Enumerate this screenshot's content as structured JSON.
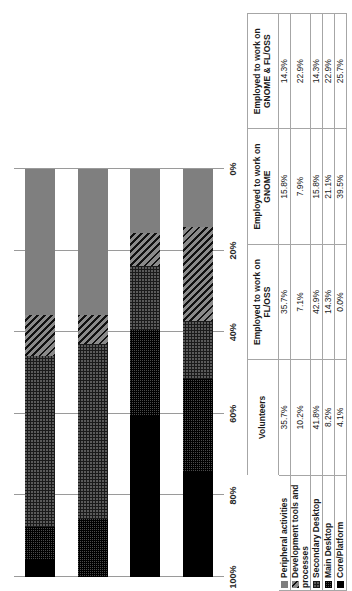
{
  "chart_data": {
    "type": "bar",
    "orientation": "vertical-stacked-100",
    "title": "",
    "subtitle": "",
    "xlabel": "",
    "ylabel": "",
    "ylim": [
      0,
      100
    ],
    "grid": true,
    "legend_position": "table-row-headers",
    "tick_labels": [
      "100%",
      "80%",
      "60%",
      "40%",
      "20%",
      "0%"
    ],
    "tick_values": [
      100,
      80,
      60,
      40,
      20,
      0
    ],
    "categories": [
      "Volunteers",
      "Employed to work on FL/OSS",
      "Employed to work on GNOME",
      "Employed to work on GNOME & FL/OSS"
    ],
    "series": [
      {
        "name": "Peripheral activities",
        "pattern": "solid-gray",
        "color": "#7f7f7f",
        "values": [
          35.7,
          35.7,
          15.8,
          14.3
        ],
        "labels": [
          "35.7%",
          "35.7%",
          "15.8%",
          "14.3%"
        ]
      },
      {
        "name": "Development tools and processes",
        "pattern": "diagonal-stripes",
        "color": "#3d3d3d",
        "values": [
          10.2,
          7.1,
          7.9,
          22.9
        ],
        "labels": [
          "10.2%",
          "7.1%",
          "7.9%",
          "22.9%"
        ]
      },
      {
        "name": "Secondary Desktop",
        "pattern": "fine-grid",
        "color": "#5a5a5a",
        "values": [
          41.8,
          42.9,
          15.8,
          14.3
        ],
        "labels": [
          "41.8%",
          "42.9%",
          "15.8%",
          "14.3%"
        ]
      },
      {
        "name": "Main Desktop",
        "pattern": "dots",
        "color": "#4a4a4a",
        "values": [
          8.2,
          14.3,
          21.1,
          22.9
        ],
        "labels": [
          "8.2%",
          "14.3%",
          "21.1%",
          "22.9%"
        ]
      },
      {
        "name": "Core/Platform",
        "pattern": "solid-black",
        "color": "#000000",
        "values": [
          4.1,
          0.0,
          39.5,
          25.7
        ],
        "labels": [
          "4.1%",
          "0.0%",
          "39.5%",
          "25.7%"
        ]
      }
    ]
  },
  "table": {
    "column_headers": [
      "Volunteers",
      "Employed to work on FL/OSS",
      "Employed to work on GNOME",
      "Employed to work on GNOME & FL/OSS"
    ],
    "rows": [
      {
        "label": "Peripheral activities",
        "cells": [
          "35.7%",
          "35.7%",
          "15.8%",
          "14.3%"
        ]
      },
      {
        "label": "Development tools and processes",
        "cells": [
          "10.2%",
          "7.1%",
          "7.9%",
          "22.9%"
        ]
      },
      {
        "label": "Secondary Desktop",
        "cells": [
          "41.8%",
          "42.9%",
          "15.8%",
          "14.3%"
        ]
      },
      {
        "label": "Main Desktop",
        "cells": [
          "8.2%",
          "14.3%",
          "21.1%",
          "22.9%"
        ]
      },
      {
        "label": "Core/Platform",
        "cells": [
          "4.1%",
          "0.0%",
          "39.5%",
          "25.7%"
        ]
      }
    ]
  }
}
